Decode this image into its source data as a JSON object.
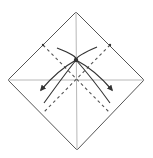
{
  "diagram": {
    "type": "origami-fold-diagram",
    "colors": {
      "background": "#ffffff",
      "outline": "#555555",
      "crease": "#b8b8b8",
      "fold_line": "#555555",
      "arrow": "#333333"
    },
    "paper": {
      "vertices": [
        [
          76,
          12
        ],
        [
          144,
          80
        ],
        [
          77,
          150
        ],
        [
          8,
          80
        ]
      ]
    },
    "creases": [
      {
        "name": "vertical-crease",
        "from": [
          76,
          12
        ],
        "to": [
          77,
          150
        ]
      },
      {
        "name": "horizontal-crease",
        "from": [
          8,
          80
        ],
        "to": [
          144,
          80
        ]
      }
    ],
    "valley_folds": [
      {
        "name": "valley-fold-1",
        "from": [
          43,
          45
        ],
        "to": [
          110,
          113
        ]
      },
      {
        "name": "valley-fold-2",
        "from": [
          110,
          45
        ],
        "to": [
          43,
          113
        ]
      }
    ],
    "arrows": [
      {
        "name": "fold-arrow-left",
        "path": "M57 48 Q 78 56 76 60 Q 58 70 41 90"
      },
      {
        "name": "fold-arrow-right",
        "path": "M97 47 Q 76 56 76 60 Q 95 70 112 90"
      }
    ],
    "marks": [
      {
        "name": "center-dot",
        "at": [
          76,
          60
        ]
      },
      {
        "name": "edge-tick-left",
        "at": [
          43,
          45
        ]
      },
      {
        "name": "edge-tick-right",
        "at": [
          110,
          45
        ]
      }
    ]
  }
}
